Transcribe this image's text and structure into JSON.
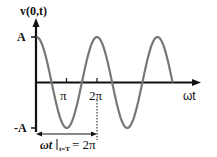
{
  "figure": {
    "y_axis_label": "v(0,t)",
    "x_axis_label": "ωt",
    "y_ticks": {
      "top": "A",
      "bottom": "-A"
    },
    "x_ticks": [
      "π",
      "2π"
    ],
    "annotation": "ωt |t=T = 2π",
    "annotation_main": "ωt",
    "annotation_sub": "t=T",
    "annotation_eq": "= 2π",
    "curve": "A cos(ωt)",
    "curve_color": "#777777",
    "axis_color": "#111111"
  }
}
